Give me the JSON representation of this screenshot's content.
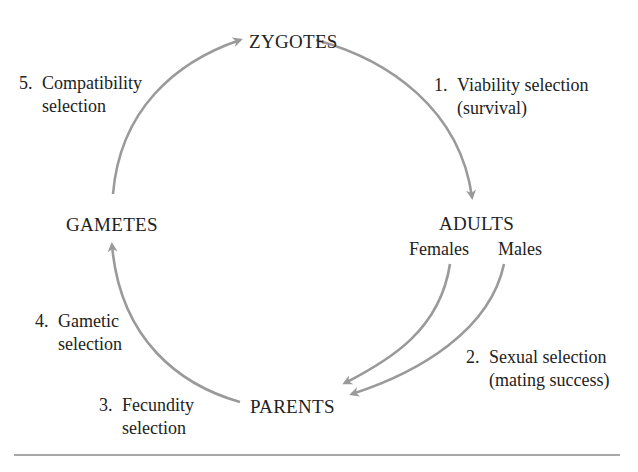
{
  "diagram": {
    "colors": {
      "arrow": "#9a9a9a",
      "text": "#222222",
      "rule": "#a8a8a8"
    },
    "nodes": {
      "zygotes": "ZYGOTES",
      "adults": "ADULTS",
      "adults_females": "Females",
      "adults_males": "Males",
      "parents": "PARENTS",
      "gametes": "GAMETES"
    },
    "stages": [
      {
        "number": "1.",
        "line1": "Viability selection",
        "line2": "(survival)"
      },
      {
        "number": "2.",
        "line1": "Sexual selection",
        "line2": "(mating success)"
      },
      {
        "number": "3.",
        "line1": "Fecundity",
        "line2": "selection"
      },
      {
        "number": "4.",
        "line1": "Gametic",
        "line2": "selection"
      },
      {
        "number": "5.",
        "line1": "Compatibility",
        "line2": "selection"
      }
    ],
    "edges": [
      {
        "from": "ZYGOTES",
        "to": "ADULTS",
        "label": "1. Viability selection (survival)"
      },
      {
        "from": "Females",
        "to": "PARENTS",
        "label": "2. Sexual selection (mating success)"
      },
      {
        "from": "Males",
        "to": "PARENTS",
        "label": "2. Sexual selection (mating success)"
      },
      {
        "from": "PARENTS",
        "to": "GAMETES",
        "label": "3. Fecundity selection / 4. Gametic selection"
      },
      {
        "from": "GAMETES",
        "to": "ZYGOTES",
        "label": "5. Compatibility selection"
      }
    ]
  }
}
